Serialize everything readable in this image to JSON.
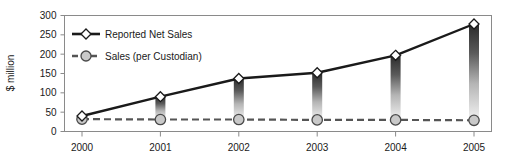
{
  "chart_data": {
    "type": "line",
    "title": "",
    "xlabel": "",
    "ylabel": "$ million",
    "categories": [
      "2000",
      "2001",
      "2002",
      "2003",
      "2004",
      "2005"
    ],
    "ylim": [
      0,
      300
    ],
    "yticks": [
      "0",
      "50",
      "100",
      "150",
      "200",
      "250",
      "300"
    ],
    "ytick_values": [
      0,
      50,
      100,
      150,
      200,
      250,
      300
    ],
    "grid": false,
    "legend_position": "upper-left inside plot",
    "series": [
      {
        "name": "Reported Net Sales",
        "marker": "diamond",
        "linestyle": "solid",
        "color": "#1a1a1a",
        "values": [
          40,
          90,
          137,
          152,
          197,
          278
        ]
      },
      {
        "name": "Sales (per Custodian)",
        "marker": "circle",
        "linestyle": "dashed",
        "color": "#555555",
        "values": [
          32,
          31,
          31,
          30,
          30,
          29
        ]
      }
    ],
    "connector_bars": {
      "description": "vertical gradient bars linking the two series at each year",
      "gradient_top": "#2b2b2b",
      "gradient_bottom": "#f0f0f0"
    }
  },
  "legend": {
    "items": [
      {
        "label": "Reported Net Sales",
        "marker": "diamond-marker",
        "line": "solid-line"
      },
      {
        "label": "Sales (per Custodian)",
        "marker": "circle-marker",
        "line": "dashed-line"
      }
    ]
  },
  "axis": {
    "y_title": "$ million"
  },
  "colors": {
    "frame": "#8a8a8a",
    "series1": "#1a1a1a",
    "series2": "#555555",
    "marker_fill_diamond": "#ffffff",
    "marker_fill_circle": "#c9c9c9",
    "background": "#ffffff"
  }
}
